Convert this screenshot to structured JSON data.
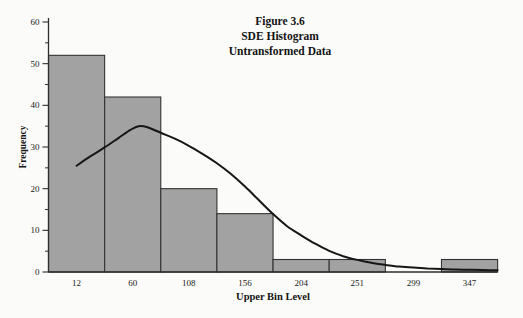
{
  "chart_data": {
    "type": "bar",
    "subtype": "histogram-with-normal-curve",
    "title": "Figure 3.6 SDE Histogram Untransformed Data",
    "title_lines": [
      "Figure 3.6",
      "SDE Histogram",
      "Untransformed Data"
    ],
    "xlabel": "Upper Bin Level",
    "ylabel": "Frequency",
    "categories": [
      "12",
      "60",
      "108",
      "156",
      "204",
      "251",
      "299",
      "347"
    ],
    "values": [
      52,
      42,
      20,
      14,
      3,
      3,
      0,
      3
    ],
    "bin_width": 48,
    "ylim": [
      0,
      60
    ],
    "y_major_ticks": [
      0,
      10,
      20,
      30,
      40,
      50,
      60
    ],
    "y_minor_ticks": [
      5,
      15,
      25,
      35,
      45,
      55
    ],
    "grid": false,
    "legend": "none",
    "overlay_curve": {
      "name": "fitted-normal-curve",
      "type": "line",
      "points": [
        [
          12,
          25.5
        ],
        [
          24,
          27.8
        ],
        [
          36,
          29.9
        ],
        [
          48,
          32.2
        ],
        [
          58,
          34.1
        ],
        [
          65,
          35.0
        ],
        [
          72,
          34.8
        ],
        [
          84,
          33.4
        ],
        [
          96,
          32.0
        ],
        [
          108,
          30.3
        ],
        [
          120,
          28.3
        ],
        [
          132,
          26.1
        ],
        [
          144,
          23.5
        ],
        [
          156,
          20.5
        ],
        [
          168,
          17.2
        ],
        [
          180,
          13.9
        ],
        [
          192,
          11.0
        ],
        [
          204,
          8.8
        ],
        [
          216,
          6.8
        ],
        [
          228,
          5.1
        ],
        [
          240,
          3.8
        ],
        [
          252,
          2.9
        ],
        [
          264,
          2.2
        ],
        [
          276,
          1.7
        ],
        [
          288,
          1.3
        ],
        [
          300,
          1.05
        ],
        [
          312,
          0.85
        ],
        [
          324,
          0.72
        ],
        [
          336,
          0.6
        ],
        [
          348,
          0.52
        ],
        [
          360,
          0.45
        ],
        [
          372,
          0.4
        ]
      ]
    },
    "colors": {
      "background": "#fbfbf9",
      "bar_fill": "#a2a2a2",
      "bar_stroke": "#333333",
      "curve": "#161616",
      "axis": "#2e2e2e",
      "text": "#141414"
    }
  }
}
